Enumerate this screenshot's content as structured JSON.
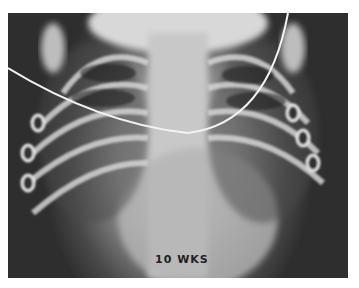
{
  "image": {
    "description": "Anterior-posterior chest radiograph of an infant with an overlying catheter/wire",
    "annotation_text": "10 WKS",
    "palette": {
      "background": "#ffffff",
      "dark_lung": "#2e2e2e",
      "mid_tissue": "#9a9a9a",
      "bright_bone": "#e0e0e0"
    }
  }
}
